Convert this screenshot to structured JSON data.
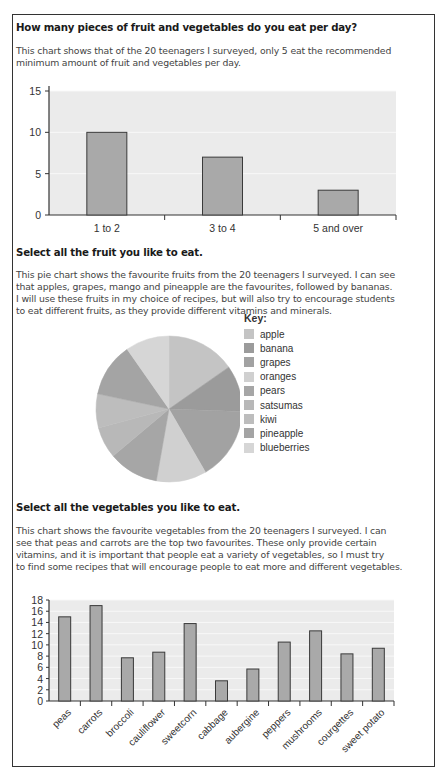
{
  "section1": {
    "question": "How many pieces of fruit and vegetables do you eat per day?",
    "description_line1": "This chart shows that of the 20 teenagers I surveyed, only 5 eat the recommended",
    "description_line2": "minimum amount of fruit and vegetables per day."
  },
  "section2": {
    "question": "Select all the fruit you like to eat.",
    "description_line1": "This pie chart shows the favourite fruits from the 20 teenagers I surveyed. I can see",
    "description_line2": "that apples, grapes, mango and pineapple are the favourites, followed by bananas.",
    "description_line3": "I will use these fruits in my choice of recipes, but will also try to encourage students",
    "description_line4": "to eat different fruits, as they provide different vitamins and minerals.",
    "key_title": "Key:"
  },
  "section3": {
    "question": "Select all the vegetables you like to eat.",
    "description_line1": "This chart shows the favourite vegetables from the 20 teenagers I surveyed. I can",
    "description_line2": "see that peas and carrots are the top two favourites. These only provide certain",
    "description_line3": "vitamins, and it is important that people eat a variety of vegetables, so I must try",
    "description_line4": "to find some recipes that will encourage people to eat more and different vegetables."
  },
  "colors": {
    "plot_background": "#ebebeb",
    "bar_fill": "#a9a9a9",
    "bar_stroke": "#3a3a3a",
    "frame_border": "#333333"
  },
  "chart_data": [
    {
      "type": "bar",
      "title": "How many pieces of fruit and vegetables do you eat per day?",
      "categories": [
        "1 to 2",
        "3 to 4",
        "5 and over"
      ],
      "values": [
        10,
        7,
        3
      ],
      "xlabel": "",
      "ylabel": "",
      "ylim": [
        0,
        15
      ],
      "yticks": [
        0,
        5,
        10,
        15
      ],
      "grid": true
    },
    {
      "type": "pie",
      "title": "Select all the fruit you like to eat.",
      "legend_title": "Key:",
      "legend_position": "right",
      "categories": [
        "apple",
        "banana",
        "grapes",
        "oranges",
        "pears",
        "satsumas",
        "kiwi",
        "pineapple",
        "blueberries"
      ],
      "values": [
        55,
        37,
        58,
        40,
        40,
        25,
        27,
        43,
        35
      ],
      "colors": [
        "#c4c4c4",
        "#9b9b9b",
        "#a2a2a2",
        "#d0d0d0",
        "#a6a6a6",
        "#b8b8b8",
        "#bdbdbd",
        "#a4a4a4",
        "#d6d6d6"
      ]
    },
    {
      "type": "bar",
      "title": "Select all the vegetables you like to eat.",
      "categories": [
        "peas",
        "carrots",
        "broccoli",
        "cauliflower",
        "sweetcorn",
        "cabbage",
        "aubergine",
        "peppers",
        "mushrooms",
        "courgettes",
        "sweet potato"
      ],
      "values": [
        15,
        17,
        7.7,
        8.7,
        13.8,
        3.6,
        5.7,
        10.5,
        12.5,
        8.4,
        9.4
      ],
      "xlabel": "",
      "ylabel": "",
      "ylim": [
        0,
        18
      ],
      "yticks": [
        0,
        2,
        4,
        6,
        8,
        10,
        12,
        14,
        16,
        18
      ],
      "grid": true
    }
  ]
}
